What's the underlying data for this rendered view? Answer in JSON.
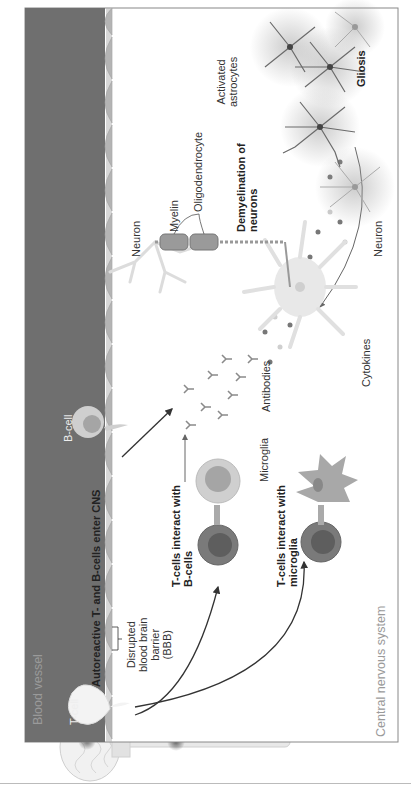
{
  "diagram": {
    "orientation": "rotated-90-ccw",
    "regions": {
      "blood_vessel": "Blood vessel",
      "cns": "Central nervous system"
    },
    "labels": {
      "t_cell": "T-cell",
      "b_cell": "B-cell",
      "enter_cns": "Autoreactive T- and B-cells enter CNS",
      "bbb_line1": "Disrupted",
      "bbb_line2": "blood brain",
      "bbb_line3": "barrier",
      "bbb_line4": "(BBB)",
      "tb_line1": "T-cells interact with",
      "tb_line2": "B-cells",
      "tm_line1": "T-cells interact with",
      "tm_line2": "microglia",
      "microglia": "Microglia",
      "cytokines": "Cytokines",
      "antibodies": "Antibodies",
      "neuron_left": "Neuron",
      "neuron_right": "Neuron",
      "myelin": "Myelin",
      "oligodendrocyte": "Oligodendrocyte",
      "demy_line1": "Demyelination of",
      "demy_line2": "neurons",
      "astro_line1": "Activated",
      "astro_line2": "astrocytes",
      "gliosis": "Gliosis"
    },
    "colors": {
      "vessel": "#6f6f6f",
      "vessel_text": "#a9a9a9",
      "endothelium": "#b9b9b9",
      "frame": "#888888",
      "tcell": "#7a7a7a",
      "tcell_nucleus": "#5e5e5e",
      "bcell": "#bdbdbd",
      "bcell_nucleus": "#9d9d9d",
      "microglia": "#9a9a9a",
      "neuron": "#e2e2e2",
      "astrocyte": "#6a6a6a",
      "cytokine_dark": "#777777",
      "cytokine_light": "#c8c8c8"
    }
  }
}
